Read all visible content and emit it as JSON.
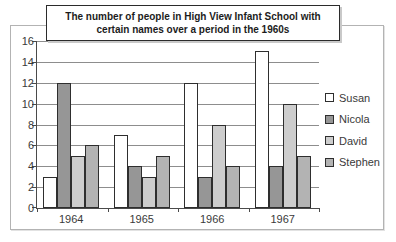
{
  "chart_data": {
    "type": "bar",
    "title": "The number of people in High View Infant School with certain names over a period in the 1960s",
    "title_lines": [
      "The number of people in High View Infant School with",
      "certain names over a period in the 1960s"
    ],
    "categories": [
      "1964",
      "1965",
      "1966",
      "1967"
    ],
    "series": [
      {
        "name": "Susan",
        "color": "#ffffff",
        "values": [
          3,
          7,
          12,
          15
        ]
      },
      {
        "name": "Nicola",
        "color": "#969696",
        "values": [
          12,
          4,
          3,
          4
        ]
      },
      {
        "name": "David",
        "color": "#cdcdcd",
        "values": [
          5,
          3,
          8,
          10
        ]
      },
      {
        "name": "Stephen",
        "color": "#b3b3b3",
        "values": [
          6,
          5,
          4,
          5
        ]
      }
    ],
    "xlabel": "",
    "ylabel": "",
    "ylim": [
      0,
      16
    ],
    "yticks": [
      0,
      2,
      4,
      6,
      8,
      10,
      12,
      14,
      16
    ],
    "grid": "horizontal",
    "legend_position": "right"
  },
  "colors": {
    "axis": "#4a4a4a",
    "gridline": "#8d8d8d",
    "bar_border": "#2e2e2e",
    "frame_border": "#b3b3b3",
    "title_border": "#2b2b2b"
  }
}
